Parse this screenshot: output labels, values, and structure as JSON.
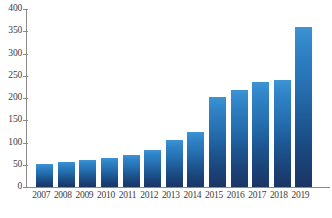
{
  "chart_data": {
    "type": "bar",
    "title": "",
    "subtitle": "",
    "xlabel": "",
    "ylabel": "",
    "categories": [
      "2007",
      "2008",
      "2009",
      "2010",
      "2011",
      "2012",
      "2013",
      "2014",
      "2015",
      "2016",
      "2017",
      "2018",
      "2019"
    ],
    "values": [
      51,
      56,
      60,
      66,
      73,
      83,
      106,
      124,
      203,
      218,
      235,
      241,
      359
    ],
    "series": [
      {
        "name": "",
        "values": [
          51,
          56,
          60,
          66,
          73,
          83,
          106,
          124,
          203,
          218,
          235,
          241,
          359
        ]
      }
    ],
    "ylim": [
      0,
      400
    ],
    "yticks": [
      0,
      50,
      100,
      150,
      200,
      250,
      300,
      350,
      400
    ],
    "ytick_labels": [
      "0",
      "50",
      "100",
      "150",
      "200",
      "250",
      "300",
      "350",
      "400"
    ],
    "grid": false,
    "legend": null,
    "legend_position": "none",
    "annotations": [],
    "colors": {
      "bar_top": "#3d93d4",
      "bar_bottom": "#1b3565",
      "axis": "#8a8a8a",
      "tick_text": "#3d3d3d",
      "background": "#ffffff"
    }
  }
}
